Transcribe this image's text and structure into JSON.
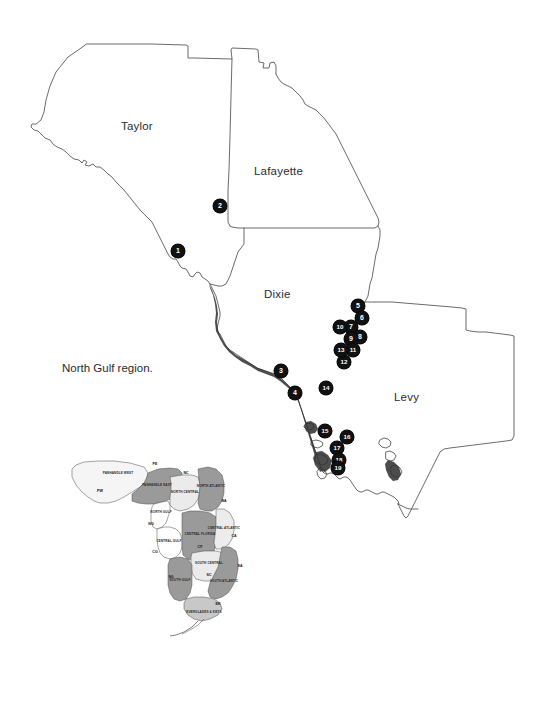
{
  "figure": {
    "caption": "North Gulf region.",
    "caption_pos": {
      "x": 62,
      "y": 362
    }
  },
  "main_map": {
    "counties": [
      {
        "name": "Taylor",
        "x": 121,
        "y": 120
      },
      {
        "name": "Lafayette",
        "x": 254,
        "y": 165
      },
      {
        "name": "Dixie",
        "x": 264,
        "y": 288
      },
      {
        "name": "Levy",
        "x": 394,
        "y": 391
      }
    ],
    "markers": [
      {
        "label": "1",
        "x": 178,
        "y": 251
      },
      {
        "label": "2",
        "x": 220,
        "y": 206
      },
      {
        "label": "3",
        "x": 281,
        "y": 371
      },
      {
        "label": "4",
        "x": 295,
        "y": 393
      },
      {
        "label": "5",
        "x": 358,
        "y": 306
      },
      {
        "label": "6",
        "x": 362,
        "y": 318
      },
      {
        "label": "7",
        "x": 351,
        "y": 327
      },
      {
        "label": "8",
        "x": 360,
        "y": 337
      },
      {
        "label": "9",
        "x": 351,
        "y": 339
      },
      {
        "label": "10",
        "x": 340,
        "y": 327
      },
      {
        "label": "11",
        "x": 353,
        "y": 350
      },
      {
        "label": "12",
        "x": 344,
        "y": 362
      },
      {
        "label": "13",
        "x": 341,
        "y": 350
      },
      {
        "label": "14",
        "x": 326,
        "y": 388
      },
      {
        "label": "15",
        "x": 325,
        "y": 431
      },
      {
        "label": "16",
        "x": 347,
        "y": 437
      },
      {
        "label": "17",
        "x": 337,
        "y": 448
      },
      {
        "label": "18",
        "x": 339,
        "y": 460
      },
      {
        "label": "19",
        "x": 338,
        "y": 468
      }
    ]
  },
  "inset_map": {
    "title": "Florida regions",
    "regions": [
      {
        "name": "PANHANDLE WEST",
        "code": "PW",
        "name_x": 60,
        "name_y": 27,
        "code_x": 42,
        "code_y": 44,
        "fill": "#f2f2f2"
      },
      {
        "name": "PANHANDLE EAST",
        "code": "PE",
        "name_x": 91,
        "name_y": 39,
        "code_x": 91,
        "code_y": 17,
        "fill": "#9a9a9a"
      },
      {
        "name": "NORTH GULF",
        "code": "NG",
        "name_x": 110,
        "name_y": 56,
        "code_x": 104,
        "code_y": 70,
        "fill": "#ffffff"
      },
      {
        "name": "NORTH CENTRAL",
        "code": "NC",
        "name_x": 129,
        "name_y": 50,
        "code_x": 124,
        "code_y": 30,
        "fill": "#e8e8e8"
      },
      {
        "name": "NORTH ATLANTIC",
        "code": "NA",
        "name_x": 152,
        "name_y": 36,
        "code_x": 163,
        "code_y": 50,
        "fill": "#9a9a9a"
      },
      {
        "name": "CENTRAL GULF",
        "code": "CG",
        "name_x": 117,
        "name_y": 83,
        "code_x": 103,
        "code_y": 93,
        "fill": "#ffffff"
      },
      {
        "name": "CENTRAL FLORIDA",
        "code": "CF",
        "name_x": 143,
        "name_y": 85,
        "code_x": 143,
        "code_y": 96,
        "fill": "#9a9a9a"
      },
      {
        "name": "CENTRAL ATLANTIC",
        "code": "CA",
        "name_x": 160,
        "name_y": 71,
        "code_x": 170,
        "code_y": 82,
        "fill": "#e8e8e8"
      },
      {
        "name": "SOUTH CENTRAL",
        "code": "SC",
        "name_x": 150,
        "name_y": 113,
        "code_x": 150,
        "code_y": 125,
        "fill": "#e8e8e8"
      },
      {
        "name": "SOUTH GULF",
        "code": "SG",
        "name_x": 132,
        "name_y": 128,
        "code_x": 120,
        "code_y": 124,
        "fill": "#9a9a9a"
      },
      {
        "name": "SOUTH ATLANTIC",
        "code": "SA",
        "name_x": 170,
        "name_y": 133,
        "code_x": 180,
        "code_y": 116,
        "fill": "#9a9a9a"
      },
      {
        "name": "EVERGLADES\n& KEYS",
        "code": "EK",
        "name_x": 152,
        "name_y": 169,
        "code_x": 160,
        "code_y": 160,
        "fill": "#c8c8c8"
      }
    ]
  },
  "colors": {
    "marker_fill": "#111111",
    "marker_text": "#ffffff",
    "outline": "#5a5a5a",
    "label_text": "#2b2b2b",
    "background": "#ffffff"
  }
}
